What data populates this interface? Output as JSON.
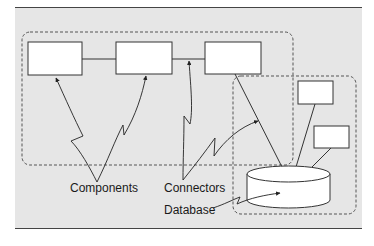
{
  "diagram": {
    "type": "architecture",
    "colors": {
      "panel": "#e6e6e6",
      "box_fill": "#ffffff",
      "stroke": "#333333",
      "dashed": "#555555"
    },
    "groups": [
      {
        "id": "components-group",
        "style": "dashed-rounded"
      },
      {
        "id": "database-group",
        "style": "dashed-rounded"
      }
    ],
    "nodes": [
      {
        "id": "component-1",
        "shape": "rect"
      },
      {
        "id": "component-2",
        "shape": "rect"
      },
      {
        "id": "component-3",
        "shape": "rect"
      },
      {
        "id": "client-a",
        "shape": "rect"
      },
      {
        "id": "client-b",
        "shape": "rect"
      },
      {
        "id": "database",
        "shape": "cylinder"
      }
    ],
    "edges": [
      {
        "from": "component-1",
        "to": "component-2"
      },
      {
        "from": "component-2",
        "to": "component-3"
      },
      {
        "from": "component-3",
        "to": "database"
      },
      {
        "from": "client-a",
        "to": "database"
      },
      {
        "from": "client-b",
        "to": "database"
      }
    ],
    "labels": {
      "components": "Components",
      "connectors": "Connectors",
      "database": "Database"
    }
  }
}
